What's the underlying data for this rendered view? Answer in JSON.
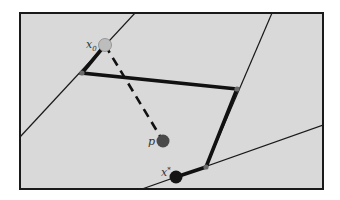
{
  "figure": {
    "frame": {
      "x": 20,
      "y": 13,
      "width": 303,
      "height": 176,
      "fill": "#d9d9d9",
      "stroke": "#1a1a1a"
    },
    "constraint_lines": [
      {
        "name": "line-1",
        "x1": 20,
        "y1": 137,
        "x2": 135,
        "y2": 13
      },
      {
        "name": "line-2",
        "x1": 272,
        "y1": 13,
        "x2": 206,
        "y2": 167
      },
      {
        "name": "line-3",
        "x1": 142,
        "y1": 189,
        "x2": 323,
        "y2": 125
      }
    ],
    "path": {
      "points": "105,45 82,73 237,89 206,167 176,177",
      "color": "#111111"
    },
    "vertices": [
      {
        "name": "vertex-1",
        "cx": 82,
        "cy": 73
      },
      {
        "name": "vertex-2",
        "cx": 237,
        "cy": 89
      },
      {
        "name": "vertex-3",
        "cx": 206,
        "cy": 167
      }
    ],
    "projection": {
      "x1": 105,
      "y1": 45,
      "x2": 163,
      "y2": 141
    },
    "points": {
      "x0": {
        "label": "x",
        "sub": "0",
        "cx": 105,
        "cy": 45,
        "fill": "#bdbdbd"
      },
      "p": {
        "label": "p",
        "cx": 163,
        "cy": 141,
        "fill": "#4a4a4a"
      },
      "xstar": {
        "label": "x",
        "sup": "*",
        "cx": 176,
        "cy": 177,
        "fill": "#141414"
      }
    }
  }
}
